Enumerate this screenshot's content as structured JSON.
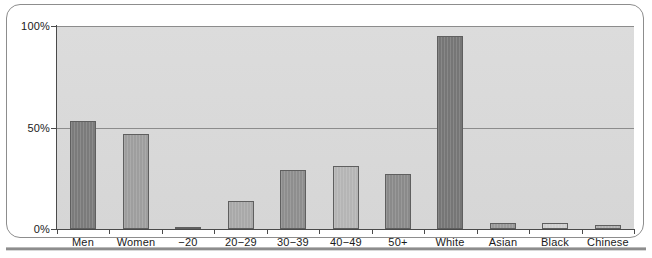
{
  "chart_data": {
    "type": "bar",
    "title": "",
    "subtitle": "",
    "xlabel": "",
    "ylabel": "",
    "categories": [
      "Men",
      "Women",
      "−20",
      "20−29",
      "30−39",
      "40−49",
      "50+",
      "White",
      "Asian",
      "Black",
      "Chinese"
    ],
    "values": [
      53,
      47,
      1,
      14,
      29,
      31,
      27,
      95,
      3,
      3,
      2
    ],
    "value_labels": [
      "53%",
      "47%",
      "1%",
      "14%",
      "29%",
      "31%",
      "27%",
      "95%",
      "3%",
      "3%",
      "2%"
    ],
    "bar_colors": [
      "#7b7b7b",
      "#9e9e9e",
      "#e2e2e2",
      "#a9a9a9",
      "#8e8e8e",
      "#b5b5b5",
      "#8a8a8a",
      "#767676",
      "#9a9a9a",
      "#cfcfcf",
      "#b0b0b0"
    ],
    "ylim": [
      0,
      100
    ],
    "ytick_values": [
      0,
      50,
      100
    ],
    "ytick_labels": [
      "0%",
      "50%",
      "100%"
    ],
    "grid": true,
    "gridlines_at": [
      50,
      100
    ],
    "legend": [],
    "legend_position": "none",
    "plot_background": "#d9d9d9",
    "axis_color": "#4a4a4a",
    "gridline_color": "#8c8c8c"
  },
  "frame": {
    "border_color": "#8d8d8d",
    "rule_color": "#8d8d8d"
  }
}
